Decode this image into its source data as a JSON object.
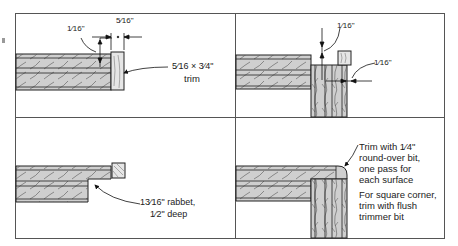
{
  "diagram": {
    "type": "woodworking-joinery-steps",
    "layout": "2x2 panel grid",
    "panels": [
      {
        "id": "top-left",
        "labels": {
          "overhang": "1⁄16\"",
          "trim_thickness": "5⁄16\"",
          "trim_size_line1": "5⁄16 × 3⁄4\"",
          "trim_size_line2": "trim"
        }
      },
      {
        "id": "top-right",
        "labels": {
          "top_overhang": "1⁄16\"",
          "side_overhang": "1⁄16\""
        }
      },
      {
        "id": "bottom-left",
        "labels": {
          "rabbet_line1": "13⁄16\" rabbet,",
          "rabbet_line2": "1⁄2\" deep"
        }
      },
      {
        "id": "bottom-right",
        "labels": {
          "roundover_line1": "Trim with 1⁄4\"",
          "roundover_line2": "round-over bit,",
          "roundover_line3": "one pass for",
          "roundover_line4": "each surface",
          "square_line1": "For square corner,",
          "square_line2": "trim with flush",
          "square_line3": "trimmer bit"
        }
      }
    ],
    "colors": {
      "line": "#2a2a2a",
      "wood_fill": "#cfcfcf",
      "trim_fill": "#e6e6e6",
      "frame": "#555555",
      "background": "#ffffff"
    }
  }
}
